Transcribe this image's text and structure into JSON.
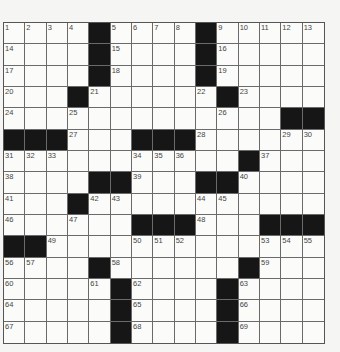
{
  "puzzle": {
    "rows": 15,
    "cols": 15,
    "layout": [
      "1 2 3 4 # 5 6 7 8 # 9 10 11 12 13",
      "14 . . . # 15 . . . # 16 . . . .",
      "17 . . . # 18 . . . # 19 . . . .",
      "20 . . # 21 . . . . 22 # 23 . . .",
      "24 . . 25 . . . . . . 26 . . # #",
      "# # # 27 . . # # # 28 . . . 29 30",
      "31 32 33 . . . 34 35 36 . . # 37 . .",
      "38 . . . # # 39 . . # # 40 . . .",
      "41 . . # 42 43 . . . 44 45 . . . .",
      "46 . . 47 . . # # # 48 . . # # #",
      "# # 49 . . . 50 51 52 . . . 53 54 55",
      "56 57 . . # 58 . . . . . # 59 . .",
      "60 . . . 61 # 62 . . . # 63 . . .",
      "64 . . . . # 65 . . . # 66 . . .",
      "67 . . . . # 68 . . . # 69 . . ."
    ]
  },
  "colors": {
    "black_square": "#161616",
    "white_square": "#fbfbf9",
    "grid_line": "#6a6a6a",
    "number_text": "#444444"
  }
}
